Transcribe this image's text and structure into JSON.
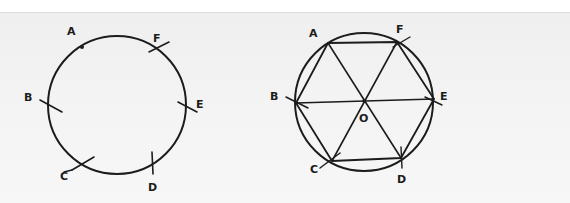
{
  "figure": {
    "left": {
      "description": "Circle with six points stepped off by compass arcs",
      "circle": {
        "cx": 117,
        "cy": 105,
        "r": 69
      },
      "labels": [
        {
          "text": "A",
          "x": 67,
          "y": 35
        },
        {
          "text": "F",
          "x": 153,
          "y": 42
        },
        {
          "text": "B",
          "x": 24,
          "y": 101
        },
        {
          "text": "E",
          "x": 196,
          "y": 108
        },
        {
          "text": "C",
          "x": 60,
          "y": 180
        },
        {
          "text": "D",
          "x": 148,
          "y": 191
        }
      ]
    },
    "right": {
      "description": "Regular hexagon inscribed in circle with diagonals through center O",
      "circle": {
        "cx": 364,
        "cy": 102,
        "r": 69
      },
      "labels": [
        {
          "text": "A",
          "x": 309,
          "y": 37
        },
        {
          "text": "F",
          "x": 396,
          "y": 33
        },
        {
          "text": "B",
          "x": 270,
          "y": 100
        },
        {
          "text": "E",
          "x": 440,
          "y": 100
        },
        {
          "text": "O",
          "x": 359,
          "y": 122
        },
        {
          "text": "C",
          "x": 310,
          "y": 173
        },
        {
          "text": "D",
          "x": 397,
          "y": 183
        }
      ]
    }
  },
  "colors": {
    "ink": "#1c1c1c",
    "paper": "#f2f2f2"
  }
}
